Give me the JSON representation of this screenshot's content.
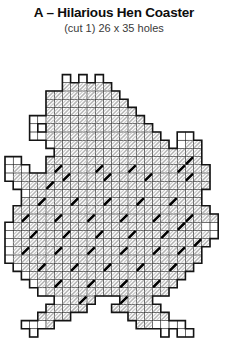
{
  "header": {
    "title": "A – Hilarious Hen Coaster",
    "subtitle": "(cut 1) 26 x 35 holes"
  },
  "chart_data": {
    "type": "heatmap",
    "title": "A – Hilarious Hen Coaster",
    "subtitle": "(cut 1) 26 x 35 holes",
    "xlabel": "",
    "ylabel": "",
    "grid": true,
    "legend": "none",
    "cols": 26,
    "rows": 35,
    "cell_size": 8.2,
    "origin": {
      "x": 5,
      "y": 6
    },
    "symbols": {
      "0": {
        "name": "empty",
        "fill": "none",
        "stroke": "none",
        "label": "no stitch"
      },
      "1": {
        "name": "plain-cell",
        "fill": "#ffffff",
        "stroke": "#1a1a1a",
        "label": "plain canvas hole"
      },
      "2": {
        "name": "light-hatch-stitch",
        "fill": "#ffffff",
        "stroke": "#a8a8a8",
        "label": "light diagonal stitch"
      },
      "3": {
        "name": "dark-slash-stitch",
        "fill": "#ffffff",
        "stroke": "#000000",
        "label": "bold diagonal stitch"
      }
    },
    "outline_color": "#141414",
    "cells": [
      "00000000000000000000000000",
      "00000000000000000000000000",
      "00000000000000000000000000",
      "00000001010100000000000000",
      "00000002222220000000000000",
      "00000222222222000000000000",
      "00000222222222200000000000",
      "00000222222222220000000000",
      "00011222222222222000000000",
      "00010222222222222200000000",
      "00011222222222222220011000",
      "00000122222222222222012200",
      "00000022222222222222222200",
      "11000222222222222222223200",
      "12100232222322232222232220",
      "12222223222232222322223220",
      "01222322222222222222222220",
      "00122222222222222222222200",
      "00223222322232223222322200",
      "02222222222222222222222220",
      "02322232223222322232223222",
      "12222222222222222222232211",
      "12232223222322232223222221",
      "12222222222222222222222320",
      "12322232223222322232232200",
      "12222222222222222222222200",
      "01223222322232223222322000",
      "00122222222222222222220000",
      "00012232223222322232200000",
      "00001222222222222222000000",
      "00000012232000322200000000",
      "00000222220002222220000000",
      "00002222000000022222000000",
      "00111200000000002211110000",
      "00010000000000000001011000"
    ]
  }
}
